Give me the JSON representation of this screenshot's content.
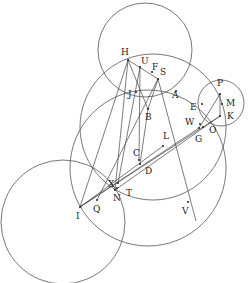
{
  "diagram": {
    "type": "geometric-construction",
    "background": "#ffffff",
    "stroke_color": "#555555",
    "circles": [
      {
        "name": "upper-circle",
        "cx": 145,
        "cy": 50,
        "r": 47
      },
      {
        "name": "middle-circle",
        "cx": 153,
        "cy": 127,
        "r": 73
      },
      {
        "name": "lower-left-circle",
        "cx": 63,
        "cy": 222,
        "r": 62
      },
      {
        "name": "small-right-circle",
        "cx": 221,
        "cy": 103,
        "r": 23
      },
      {
        "name": "arc-circle",
        "cx": 148,
        "cy": 168,
        "r": 78
      }
    ],
    "points": {
      "H": {
        "x": 128,
        "y": 60,
        "lx": 121,
        "ly": 55,
        "label": "H"
      },
      "U": {
        "x": 140,
        "y": 67,
        "lx": 141,
        "ly": 64,
        "label": "U"
      },
      "F": {
        "x": 152,
        "y": 72,
        "lx": 152,
        "ly": 70,
        "label": "F"
      },
      "S": {
        "x": 158,
        "y": 79,
        "lx": 160,
        "ly": 75,
        "label": "S"
      },
      "J": {
        "x": 136,
        "y": 92,
        "lx": 128,
        "ly": 97,
        "label": "J"
      },
      "A": {
        "x": 176,
        "y": 91,
        "lx": 172,
        "ly": 98,
        "label": "A"
      },
      "B": {
        "x": 148,
        "y": 109,
        "lx": 145,
        "ly": 120,
        "label": "B"
      },
      "P": {
        "x": 220,
        "y": 94,
        "lx": 217,
        "ly": 86,
        "label": "P"
      },
      "M": {
        "x": 222,
        "y": 104,
        "lx": 226,
        "ly": 106,
        "label": "M"
      },
      "E": {
        "x": 202,
        "y": 104,
        "lx": 190,
        "ly": 110,
        "label": "E"
      },
      "K": {
        "x": 220,
        "y": 116,
        "lx": 227,
        "ly": 119,
        "label": "K"
      },
      "W": {
        "x": 200,
        "y": 124,
        "lx": 185,
        "ly": 125,
        "label": "W"
      },
      "O": {
        "x": 203,
        "y": 127,
        "lx": 209,
        "ly": 133,
        "label": "O"
      },
      "G": {
        "x": 199,
        "y": 128,
        "lx": 195,
        "ly": 142,
        "label": "G"
      },
      "L": {
        "x": 163,
        "y": 146,
        "lx": 163,
        "ly": 139,
        "label": "L"
      },
      "C": {
        "x": 139,
        "y": 160,
        "lx": 133,
        "ly": 156,
        "label": "C"
      },
      "D": {
        "x": 140,
        "y": 164,
        "lx": 145,
        "ly": 174,
        "label": "D"
      },
      "X": {
        "x": 118,
        "y": 183,
        "lx": 108,
        "ly": 187,
        "label": "X"
      },
      "T": {
        "x": 117,
        "y": 188,
        "lx": 126,
        "ly": 196,
        "label": "T"
      },
      "N": {
        "x": 115,
        "y": 190,
        "lx": 113,
        "ly": 201,
        "label": "N"
      },
      "Q": {
        "x": 97,
        "y": 200,
        "lx": 93,
        "ly": 212,
        "label": "Q"
      },
      "I": {
        "x": 80,
        "y": 207,
        "lx": 76,
        "ly": 219,
        "label": "I"
      },
      "V": {
        "x": 188,
        "y": 202,
        "lx": 182,
        "ly": 214,
        "label": "V"
      }
    },
    "segments": [
      [
        "H",
        "I"
      ],
      [
        "H",
        "N"
      ],
      [
        "H",
        "S"
      ],
      [
        "H",
        "B"
      ],
      [
        "U",
        "X"
      ],
      [
        "U",
        "C"
      ],
      [
        "S",
        "Q"
      ],
      [
        "S",
        "V2"
      ],
      [
        "S",
        "B"
      ],
      [
        "I",
        "K"
      ],
      [
        "I",
        "G"
      ],
      [
        "I",
        "L"
      ],
      [
        "N",
        "K"
      ],
      [
        "P",
        "K"
      ],
      [
        "P",
        "G"
      ],
      [
        "B",
        "D"
      ]
    ],
    "extra_points": {
      "V2": {
        "x": 196,
        "y": 221
      }
    }
  }
}
